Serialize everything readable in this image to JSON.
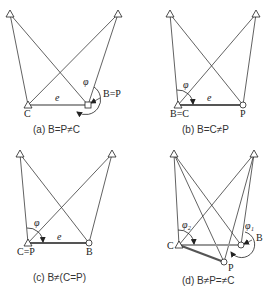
{
  "figure": {
    "panels": [
      {
        "id": "a",
        "caption": "(a) B=P≠C",
        "labels": {
          "left_point": "C",
          "right_point": "B=P",
          "angle": "φ",
          "baseline": "e"
        }
      },
      {
        "id": "b",
        "caption": "(b) B=C≠P",
        "labels": {
          "left_point": "B=C",
          "right_point": "P",
          "angle": "φ",
          "baseline": "e"
        }
      },
      {
        "id": "c",
        "caption": "(c) B≠(C=P)",
        "labels": {
          "left_point": "C=P",
          "right_point": "B",
          "angle": "φ",
          "baseline": "e"
        }
      },
      {
        "id": "d",
        "caption": "(d) B≠P=≠C",
        "labels": {
          "left_point": "C",
          "right_point": "B",
          "bottom_point": "P",
          "angle_left": "φ₂",
          "angle_right": "φ₁"
        }
      }
    ],
    "symbols": {
      "control_point": "triangle-icon",
      "station_point": "circle-icon"
    }
  }
}
